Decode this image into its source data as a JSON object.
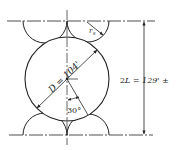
{
  "diagram": {
    "type": "engineering-dimension-sketch",
    "labels": {
      "diameter": "D = 104'",
      "radius": "r",
      "radius_sub": "s",
      "angle": "30°",
      "span_prefix": "2",
      "span": "L = 129' ±"
    },
    "colors": {
      "line": "#222222",
      "background": "#ffffff"
    }
  }
}
